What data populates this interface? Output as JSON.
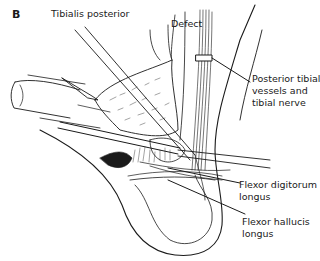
{
  "figure": {
    "panel_label": "B",
    "labels": {
      "tibialis_posterior": "Tibialis posterior",
      "defect": "Defect",
      "posterior_tibial_1": "Posterior tibial",
      "posterior_tibial_2": "vessels and",
      "posterior_tibial_3": "tibial nerve",
      "fdl_1": "Flexor digitorum",
      "fdl_2": "longus",
      "fhl_1": "Flexor hallucis",
      "fhl_2": "longus"
    },
    "colors": {
      "ink": "#1a1a1a",
      "background": "#ffffff"
    }
  }
}
